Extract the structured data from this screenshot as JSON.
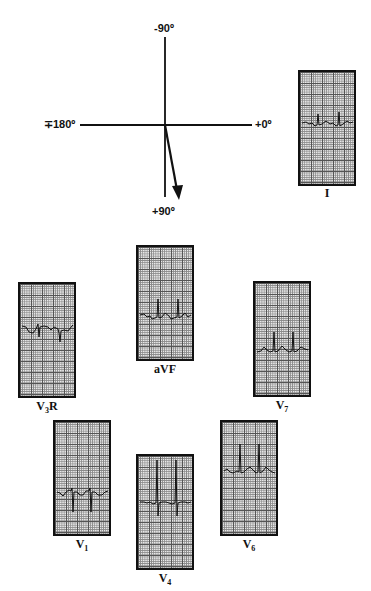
{
  "axis": {
    "top_label": "-90º",
    "bottom_label": "+90º",
    "left_label": "∓180º",
    "right_label": "+0º",
    "vector_direction_deg": 80
  },
  "leads": [
    {
      "id": "I",
      "label": "I",
      "sub": ""
    },
    {
      "id": "aVF",
      "label": "aVF",
      "sub": ""
    },
    {
      "id": "V3R",
      "label": "V",
      "sub": "3",
      "suffix": "R"
    },
    {
      "id": "V7",
      "label": "V",
      "sub": "7",
      "suffix": ""
    },
    {
      "id": "V1",
      "label": "V",
      "sub": "1",
      "suffix": ""
    },
    {
      "id": "V4",
      "label": "V",
      "sub": "4",
      "suffix": ""
    },
    {
      "id": "V6",
      "label": "V",
      "sub": "6",
      "suffix": ""
    }
  ]
}
